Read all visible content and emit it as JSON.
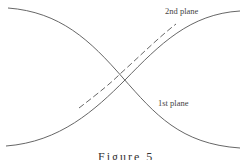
{
  "figure": {
    "labels": {
      "second_plane": "2nd plane",
      "first_plane": "1st plane"
    },
    "caption": "Figure 5",
    "colors": {
      "line": "#555555",
      "text": "#444444",
      "background": "#ffffff"
    },
    "curves": [
      {
        "name": "1st plane",
        "style": "solid",
        "from": [
          8,
          8
        ],
        "to": [
          240,
          148
        ]
      },
      {
        "name": "2nd plane",
        "style": "solid",
        "from": [
          6,
          146
        ],
        "to": [
          240,
          11
        ]
      },
      {
        "name": "2nd plane offset",
        "style": "dashed",
        "from": [
          79,
          108
        ],
        "to": [
          176,
          24
        ]
      }
    ]
  }
}
